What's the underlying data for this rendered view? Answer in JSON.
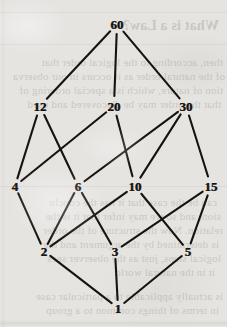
{
  "figure": {
    "kind": "hasse-diagram",
    "background_color": "#dbd9d5",
    "line_color": "#17140f",
    "label_color": "#15120f",
    "width": 227,
    "height": 327
  },
  "chart_data": {
    "type": "diagram",
    "title": "",
    "xlabel": "",
    "ylabel": "",
    "nodes": [
      {
        "id": "60",
        "label": "60",
        "x": 117,
        "y": 24,
        "rank": 4
      },
      {
        "id": "12",
        "label": "12",
        "x": 40,
        "y": 106,
        "rank": 3
      },
      {
        "id": "20",
        "label": "20",
        "x": 114,
        "y": 106,
        "rank": 3
      },
      {
        "id": "30",
        "label": "30",
        "x": 186,
        "y": 106,
        "rank": 3
      },
      {
        "id": "4",
        "label": "4",
        "x": 15,
        "y": 186,
        "rank": 2
      },
      {
        "id": "6",
        "label": "6",
        "x": 78,
        "y": 186,
        "rank": 2
      },
      {
        "id": "10",
        "label": "10",
        "x": 135,
        "y": 186,
        "rank": 2
      },
      {
        "id": "15",
        "label": "15",
        "x": 211,
        "y": 186,
        "rank": 2
      },
      {
        "id": "2",
        "label": "2",
        "x": 44,
        "y": 251,
        "rank": 1
      },
      {
        "id": "3",
        "label": "3",
        "x": 115,
        "y": 251,
        "rank": 1
      },
      {
        "id": "5",
        "label": "5",
        "x": 188,
        "y": 251,
        "rank": 1
      },
      {
        "id": "1",
        "label": "1",
        "x": 118,
        "y": 308,
        "rank": 0
      }
    ],
    "edges": [
      {
        "from": "60",
        "to": "12"
      },
      {
        "from": "60",
        "to": "20"
      },
      {
        "from": "60",
        "to": "30"
      },
      {
        "from": "12",
        "to": "4"
      },
      {
        "from": "12",
        "to": "6"
      },
      {
        "from": "20",
        "to": "4"
      },
      {
        "from": "20",
        "to": "10"
      },
      {
        "from": "30",
        "to": "6"
      },
      {
        "from": "30",
        "to": "10"
      },
      {
        "from": "30",
        "to": "15"
      },
      {
        "from": "4",
        "to": "2"
      },
      {
        "from": "6",
        "to": "2"
      },
      {
        "from": "6",
        "to": "3"
      },
      {
        "from": "10",
        "to": "2"
      },
      {
        "from": "10",
        "to": "5"
      },
      {
        "from": "15",
        "to": "3"
      },
      {
        "from": "15",
        "to": "5"
      },
      {
        "from": "2",
        "to": "1"
      },
      {
        "from": "3",
        "to": "1"
      },
      {
        "from": "5",
        "to": "1"
      }
    ]
  },
  "bleed_through": {
    "note": "faint mirrored show-through text from the reverse side of the scanned page",
    "lines": [
      {
        "text": "What is a Law?",
        "x": 8,
        "y": 18,
        "head": true
      },
      {
        "text": "then, according to the logical order that",
        "x": 4,
        "y": 56
      },
      {
        "text": "of the natural order as it occurs in our observa",
        "x": 2,
        "y": 70
      },
      {
        "text": "tion of nature, which is a special ordering of",
        "x": 4,
        "y": 84
      },
      {
        "text": "that the order may be discovered and used",
        "x": 6,
        "y": 98
      },
      {
        "text": "can be the case that it has the conclu",
        "x": 10,
        "y": 196
      },
      {
        "text": "sion, and so we may infer that it is the",
        "x": 6,
        "y": 210
      },
      {
        "text": "relation. Now the structure of the order",
        "x": 4,
        "y": 224
      },
      {
        "text": "is determined by the argument and the",
        "x": 8,
        "y": 238
      },
      {
        "text": "logical steps, just as the observer sees",
        "x": 6,
        "y": 252
      },
      {
        "text": "it in the natural world",
        "x": 12,
        "y": 266
      },
      {
        "text": "is actually applicable to a particular case",
        "x": 4,
        "y": 290
      },
      {
        "text": "in terms of things common to a group",
        "x": 8,
        "y": 304
      }
    ],
    "rules": [
      {
        "x": 0,
        "y": 12,
        "width": 227
      },
      {
        "x": 0,
        "y": 44,
        "width": 227
      },
      {
        "x": 0,
        "y": 186,
        "width": 227
      }
    ]
  }
}
